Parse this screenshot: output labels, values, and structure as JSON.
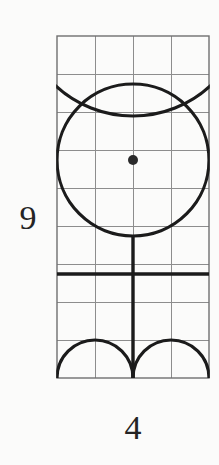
{
  "figure": {
    "title": "",
    "background_color": "#fbfbfa",
    "labels": {
      "left_label": "9",
      "bottom_label": "4"
    },
    "grid": {
      "columns": 4,
      "rows": 9,
      "cell_size_px": 38,
      "origin_x_px": 57,
      "origin_y_px": 36,
      "width_px": 152,
      "height_px": 342,
      "line_color": "#8d8d8d",
      "line_width_px": 1,
      "border_color": "#6f6f6f",
      "border_width_px": 1.4,
      "visible": true
    },
    "stroke": {
      "color": "#1b1b1b",
      "width_px": 3.2
    },
    "shapes": [
      {
        "name": "upper-arc",
        "type": "arc",
        "description": "lower portion of large circle centered above grid, spanning full grid width",
        "center_grid": [
          2,
          -1
        ],
        "radius_cells": 3,
        "start_angle_deg": 20,
        "end_angle_deg": 160
      },
      {
        "name": "main-circle",
        "type": "circle",
        "description": "large circle centered on marked point, radius two grid cells",
        "center_grid": [
          2,
          3.263
        ],
        "radius_cells": 2
      },
      {
        "name": "center-dot",
        "type": "dot",
        "description": "filled center point of main circle",
        "center_grid": [
          2,
          3.263
        ],
        "radius_px": 5
      },
      {
        "name": "vertical-stem",
        "type": "line",
        "description": "vertical line from bottom of main circle down to bottom grid edge",
        "from_grid": [
          2,
          5.263
        ],
        "to_grid": [
          2,
          9
        ]
      },
      {
        "name": "horizontal-bar",
        "type": "line",
        "description": "horizontal line across full grid width at sixth row line",
        "from_grid": [
          0,
          6.263
        ],
        "to_grid": [
          4,
          6.263
        ]
      },
      {
        "name": "bottom-left-arc",
        "type": "semicircle",
        "description": "upward semicircular arc over left two cells of bottom row",
        "center_grid": [
          1,
          9
        ],
        "radius_cells": 1
      },
      {
        "name": "bottom-right-arc",
        "type": "semicircle",
        "description": "upward semicircular arc over right two cells of bottom row",
        "center_grid": [
          3,
          9
        ],
        "radius_cells": 1
      }
    ]
  }
}
